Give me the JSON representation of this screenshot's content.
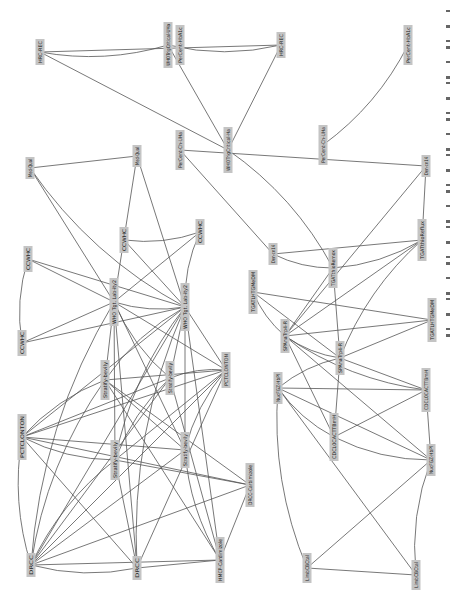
{
  "diagram": {
    "orientation": "rotated-90-ccw",
    "node_fill": "#c4c4c4",
    "edge_color": "#555555",
    "background": "#ffffff",
    "nodes": [
      {
        "id": "n1",
        "label": "HRC-REC",
        "x": 40,
        "y": 52,
        "h": 26
      },
      {
        "id": "n2",
        "label": "WHOTrigCritical-UHa",
        "x": 168,
        "y": 45,
        "h": 46
      },
      {
        "id": "n3",
        "label": "HRC-REC",
        "x": 281,
        "y": 45,
        "h": 26
      },
      {
        "id": "n4",
        "label": "WHOTrigCritical-Ha",
        "x": 228,
        "y": 150,
        "h": 46
      },
      {
        "id": "n5",
        "label": "Med-Qual",
        "x": 30,
        "y": 168,
        "h": 22
      },
      {
        "id": "n6",
        "label": "Med-Qual",
        "x": 137,
        "y": 156,
        "h": 22
      },
      {
        "id": "n7",
        "label": "PerCent-HbA1c",
        "x": 180,
        "y": 45,
        "h": 40
      },
      {
        "id": "n8",
        "label": "PerCent-Ch-UHa",
        "x": 180,
        "y": 150,
        "h": 40
      },
      {
        "id": "n9",
        "label": "CCWHC",
        "x": 28,
        "y": 259,
        "h": 26
      },
      {
        "id": "n10",
        "label": "CCWHC",
        "x": 124,
        "y": 240,
        "h": 26
      },
      {
        "id": "n11",
        "label": "CCWHC",
        "x": 200,
        "y": 232,
        "h": 26
      },
      {
        "id": "n12",
        "label": "CCWHC",
        "x": 22,
        "y": 343,
        "h": 26
      },
      {
        "id": "n13",
        "label": "WHO Tgt. Lab-ity2",
        "x": 114,
        "y": 302,
        "h": 48
      },
      {
        "id": "n14",
        "label": "WHO Tgt. Lab-ity2",
        "x": 185,
        "y": 307,
        "h": 48
      },
      {
        "id": "n15",
        "label": "PCTCLONTON",
        "x": 226,
        "y": 370,
        "h": 36
      },
      {
        "id": "n16",
        "label": "Stratify-bevily",
        "x": 105,
        "y": 380,
        "h": 40
      },
      {
        "id": "n17",
        "label": "Stratify-bevily",
        "x": 170,
        "y": 378,
        "h": 34
      },
      {
        "id": "n18",
        "label": "PCTCLONTON",
        "x": 22,
        "y": 437,
        "h": 46
      },
      {
        "id": "n19",
        "label": "Stratify-bevily",
        "x": 115,
        "y": 460,
        "h": 40
      },
      {
        "id": "n20",
        "label": "Stratify-bevily",
        "x": 185,
        "y": 450,
        "h": 36
      },
      {
        "id": "n21",
        "label": "DRCC-Carbimizole",
        "x": 250,
        "y": 485,
        "h": 44
      },
      {
        "id": "n22",
        "label": "DRCC",
        "x": 31,
        "y": 565,
        "h": 24
      },
      {
        "id": "n23",
        "label": "DRCC",
        "x": 137,
        "y": 568,
        "h": 24
      },
      {
        "id": "n24",
        "label": "HMCP-Cardimizole",
        "x": 220,
        "y": 560,
        "h": 46
      },
      {
        "id": "n25",
        "label": "Den-cn14",
        "x": 273,
        "y": 254,
        "h": 22
      },
      {
        "id": "n26",
        "label": "TGATthioRemox",
        "x": 333,
        "y": 268,
        "h": 40
      },
      {
        "id": "n27",
        "label": "TGATthioReflux",
        "x": 422,
        "y": 240,
        "h": 42
      },
      {
        "id": "n28",
        "label": "Den-cn14",
        "x": 426,
        "y": 166,
        "h": 22
      },
      {
        "id": "n29",
        "label": "TGATLHTGMeDM",
        "x": 253,
        "y": 292,
        "h": 44
      },
      {
        "id": "n30",
        "label": "SPAnaTrp4-R",
        "x": 285,
        "y": 336,
        "h": 34
      },
      {
        "id": "n31",
        "label": "SPAnaTrp4-R",
        "x": 340,
        "y": 358,
        "h": 34
      },
      {
        "id": "n32",
        "label": "TGATLHTGMeDM",
        "x": 432,
        "y": 320,
        "h": 44
      },
      {
        "id": "n33",
        "label": "NucFGZ-HbPl",
        "x": 278,
        "y": 388,
        "h": 32
      },
      {
        "id": "n34",
        "label": "CDCL0CACTTBmH",
        "x": 334,
        "y": 437,
        "h": 48
      },
      {
        "id": "n35",
        "label": "CDCL0CACTTBmH",
        "x": 426,
        "y": 390,
        "h": 44
      },
      {
        "id": "n36",
        "label": "NucFGZ-HbPl",
        "x": 431,
        "y": 460,
        "h": 32
      },
      {
        "id": "n37",
        "label": "LimbCBCtal",
        "x": 307,
        "y": 568,
        "h": 30
      },
      {
        "id": "n38",
        "label": "LimbCBCtal",
        "x": 416,
        "y": 575,
        "h": 30
      },
      {
        "id": "n39",
        "label": "PerCent-Ch-UHa",
        "x": 323,
        "y": 145,
        "h": 40
      },
      {
        "id": "n40",
        "label": "PerCent-HbA1c",
        "x": 408,
        "y": 45,
        "h": 40
      }
    ],
    "edges": [
      [
        "n1",
        "n2"
      ],
      [
        "n1",
        "n3"
      ],
      [
        "n1",
        "n4"
      ],
      [
        "n2",
        "n3"
      ],
      [
        "n2",
        "n4"
      ],
      [
        "n3",
        "n4"
      ],
      [
        "n39",
        "n40"
      ],
      [
        "n5",
        "n6"
      ],
      [
        "n5",
        "n13"
      ],
      [
        "n5",
        "n14"
      ],
      [
        "n6",
        "n13"
      ],
      [
        "n6",
        "n14"
      ],
      [
        "n9",
        "n12"
      ],
      [
        "n9",
        "n14"
      ],
      [
        "n9",
        "n13"
      ],
      [
        "n10",
        "n11"
      ],
      [
        "n10",
        "n14"
      ],
      [
        "n11",
        "n13"
      ],
      [
        "n11",
        "n14"
      ],
      [
        "n12",
        "n13"
      ],
      [
        "n12",
        "n14"
      ],
      [
        "n13",
        "n14"
      ],
      [
        "n13",
        "n15"
      ],
      [
        "n13",
        "n16"
      ],
      [
        "n13",
        "n17"
      ],
      [
        "n13",
        "n19"
      ],
      [
        "n13",
        "n20"
      ],
      [
        "n13",
        "n22"
      ],
      [
        "n13",
        "n23"
      ],
      [
        "n14",
        "n15"
      ],
      [
        "n14",
        "n16"
      ],
      [
        "n14",
        "n17"
      ],
      [
        "n14",
        "n18"
      ],
      [
        "n14",
        "n19"
      ],
      [
        "n14",
        "n20"
      ],
      [
        "n14",
        "n22"
      ],
      [
        "n14",
        "n23"
      ],
      [
        "n14",
        "n24"
      ],
      [
        "n15",
        "n16"
      ],
      [
        "n15",
        "n17"
      ],
      [
        "n15",
        "n18"
      ],
      [
        "n15",
        "n19"
      ],
      [
        "n15",
        "n20"
      ],
      [
        "n15",
        "n22"
      ],
      [
        "n15",
        "n23"
      ],
      [
        "n16",
        "n18"
      ],
      [
        "n16",
        "n20"
      ],
      [
        "n16",
        "n21"
      ],
      [
        "n16",
        "n22"
      ],
      [
        "n16",
        "n24"
      ],
      [
        "n17",
        "n18"
      ],
      [
        "n17",
        "n19"
      ],
      [
        "n17",
        "n22"
      ],
      [
        "n17",
        "n24"
      ],
      [
        "n18",
        "n19"
      ],
      [
        "n18",
        "n20"
      ],
      [
        "n18",
        "n21"
      ],
      [
        "n18",
        "n22"
      ],
      [
        "n18",
        "n23"
      ],
      [
        "n19",
        "n21"
      ],
      [
        "n19",
        "n22"
      ],
      [
        "n19",
        "n23"
      ],
      [
        "n20",
        "n22"
      ],
      [
        "n20",
        "n24"
      ],
      [
        "n21",
        "n22"
      ],
      [
        "n21",
        "n24"
      ],
      [
        "n22",
        "n23"
      ],
      [
        "n22",
        "n24"
      ],
      [
        "n23",
        "n24"
      ],
      [
        "n25",
        "n26"
      ],
      [
        "n25",
        "n27"
      ],
      [
        "n25",
        "n8"
      ],
      [
        "n26",
        "n27"
      ],
      [
        "n26",
        "n30"
      ],
      [
        "n26",
        "n31"
      ],
      [
        "n26",
        "n4"
      ],
      [
        "n27",
        "n28"
      ],
      [
        "n27",
        "n30"
      ],
      [
        "n27",
        "n31"
      ],
      [
        "n28",
        "n8"
      ],
      [
        "n28",
        "n30"
      ],
      [
        "n29",
        "n30"
      ],
      [
        "n29",
        "n31"
      ],
      [
        "n29",
        "n32"
      ],
      [
        "n30",
        "n31"
      ],
      [
        "n30",
        "n32"
      ],
      [
        "n30",
        "n34"
      ],
      [
        "n30",
        "n35"
      ],
      [
        "n30",
        "n36"
      ],
      [
        "n31",
        "n32"
      ],
      [
        "n31",
        "n33"
      ],
      [
        "n31",
        "n34"
      ],
      [
        "n31",
        "n35"
      ],
      [
        "n33",
        "n34"
      ],
      [
        "n33",
        "n35"
      ],
      [
        "n33",
        "n36"
      ],
      [
        "n33",
        "n37"
      ],
      [
        "n33",
        "n38"
      ],
      [
        "n34",
        "n35"
      ],
      [
        "n34",
        "n36"
      ],
      [
        "n35",
        "n36"
      ],
      [
        "n36",
        "n37"
      ],
      [
        "n36",
        "n38"
      ],
      [
        "n37",
        "n38"
      ]
    ]
  },
  "caption": {
    "text_marks": 28
  }
}
